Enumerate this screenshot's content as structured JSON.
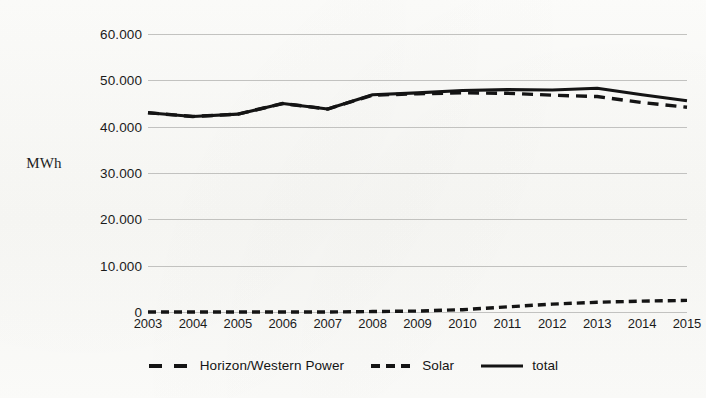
{
  "axes": {
    "y_label": "MWh",
    "y_ticks": [
      "60.000",
      "50.000",
      "40.000",
      "30.000",
      "20.000",
      "10.000",
      "0"
    ],
    "x_ticks": [
      "2003",
      "2004",
      "2005",
      "2006",
      "2007",
      "2008",
      "2009",
      "2010",
      "2011",
      "2012",
      "2013",
      "2014",
      "2015"
    ]
  },
  "legend": {
    "items": [
      {
        "label": "Horizon/Western Power",
        "style": "long-dash",
        "icon": "dashed-line-icon"
      },
      {
        "label": "Solar",
        "style": "short-dash",
        "icon": "dashed-line-icon"
      },
      {
        "label": "total",
        "style": "solid",
        "icon": "solid-line-icon"
      }
    ]
  },
  "chart_data": {
    "type": "line",
    "title": "",
    "xlabel": "",
    "ylabel": "MWh",
    "categories": [
      "2003",
      "2004",
      "2005",
      "2006",
      "2007",
      "2008",
      "2009",
      "2010",
      "2011",
      "2012",
      "2013",
      "2014",
      "2015"
    ],
    "ylim": [
      0,
      60000
    ],
    "ytick_values": [
      0,
      10000,
      20000,
      30000,
      40000,
      50000,
      60000
    ],
    "grid": true,
    "legend_position": "bottom",
    "series": [
      {
        "name": "Horizon/Western Power",
        "style": "long-dash",
        "values": [
          43000,
          42200,
          42700,
          45000,
          43800,
          46800,
          47100,
          47300,
          47200,
          46800,
          46500,
          45200,
          44200
        ]
      },
      {
        "name": "Solar",
        "style": "short-dash",
        "values": [
          0,
          0,
          0,
          0,
          0,
          100,
          200,
          500,
          1100,
          1700,
          2100,
          2350,
          2500
        ]
      },
      {
        "name": "total",
        "style": "solid",
        "values": [
          43000,
          42200,
          42700,
          45000,
          43800,
          46900,
          47300,
          47800,
          48000,
          47900,
          48300,
          46900,
          45600
        ]
      }
    ]
  }
}
